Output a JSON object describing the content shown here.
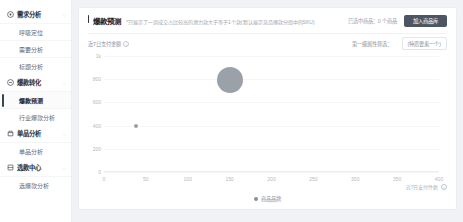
{
  "sidebar": {
    "groups": [
      {
        "label": "需求分析",
        "icon": "target-icon",
        "items": [
          {
            "label": "呼吸定位"
          },
          {
            "label": "需要分析"
          },
          {
            "label": "标题分析"
          }
        ]
      },
      {
        "label": "爆款转化",
        "icon": "flash-icon",
        "items": [
          {
            "label": "爆款预测",
            "active": true
          },
          {
            "label": "行业爆款分析",
            "active": false
          }
        ]
      },
      {
        "label": "单品分析",
        "icon": "box-icon",
        "items": [
          {
            "label": "单品分析"
          }
        ]
      },
      {
        "label": "选款中心",
        "icon": "grid-icon",
        "items": [
          {
            "label": "选爆款分析"
          }
        ]
      }
    ]
  },
  "header": {
    "title": "爆款预测",
    "subtitle": "*只展示了一周成交占比较高的潜力款大于等于1个款(默认展示竞品爆款分组中的SKU)",
    "selection_count": "已选中商品：0 个商品",
    "primary_button": "加入商品库"
  },
  "filters": {
    "axis_label": "近7日支付金额",
    "info_icon": "info-icon",
    "secondary_label": "第一级属性筛选：",
    "select_value": "(特质要素一个)"
  },
  "chart_data": {
    "type": "scatter",
    "title": "爆款预测",
    "xlabel": "近7日支付件数",
    "ylabel": "近7日支付金额",
    "xlim": [
      0,
      400
    ],
    "ylim": [
      0,
      1000
    ],
    "xticks": [
      "0",
      "50",
      "100",
      "150",
      "200",
      "250",
      "300",
      "350",
      "400"
    ],
    "xtick_values": [
      0,
      50,
      100,
      150,
      200,
      250,
      300,
      350,
      400
    ],
    "yticks": [
      "1k",
      "800",
      "600",
      "400",
      "200",
      "0"
    ],
    "ytick_values": [
      1000,
      800,
      600,
      400,
      200,
      0
    ],
    "grid": true,
    "legend": "商品品牌",
    "legend_position": "bottom",
    "series": [
      {
        "name": "商品品牌",
        "color": "#9ba1a8",
        "points": [
          {
            "x": 150,
            "y": 790,
            "size": 26
          },
          {
            "x": 38,
            "y": 400,
            "size": 4
          }
        ]
      }
    ]
  }
}
